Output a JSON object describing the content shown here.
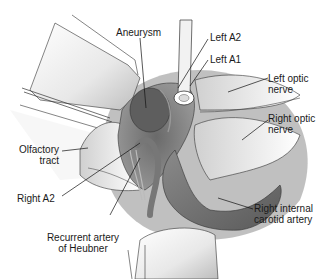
{
  "figure": {
    "type": "anatomical-illustration",
    "labels": [
      {
        "id": "aneurysm",
        "lines": [
          "Aneurysm"
        ]
      },
      {
        "id": "left-a2",
        "lines": [
          "Left A2"
        ]
      },
      {
        "id": "left-a1",
        "lines": [
          "Left A1"
        ]
      },
      {
        "id": "left-optic-nerve",
        "lines": [
          "Left optic",
          "nerve"
        ]
      },
      {
        "id": "right-optic-nerve",
        "lines": [
          "Right optic",
          "nerve"
        ]
      },
      {
        "id": "olfactory-tract",
        "lines": [
          "Olfactory",
          "tract"
        ]
      },
      {
        "id": "right-a2",
        "lines": [
          "Right A2"
        ]
      },
      {
        "id": "recurrent-artery",
        "lines": [
          "Recurrent artery",
          "of Heubner"
        ]
      },
      {
        "id": "right-ica",
        "lines": [
          "Right internal",
          "carotid artery"
        ]
      }
    ]
  }
}
